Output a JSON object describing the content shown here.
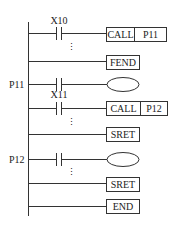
{
  "diagram": {
    "type": "ladder",
    "rungs": [
      {
        "label": "",
        "contact": "X10",
        "output": {
          "kind": "box",
          "parts": [
            "CALL",
            "P11"
          ]
        },
        "ellipsis_after": true
      },
      {
        "label": "",
        "contact": "",
        "output": {
          "kind": "box",
          "parts": [
            "FEND"
          ]
        }
      },
      {
        "label": "P11",
        "contact": "",
        "output": {
          "kind": "coil",
          "parts": []
        }
      },
      {
        "label": "",
        "contact": "X11",
        "output": {
          "kind": "box",
          "parts": [
            "CALL",
            "P12"
          ]
        },
        "ellipsis_after": true
      },
      {
        "label": "",
        "contact": "",
        "output": {
          "kind": "box",
          "parts": [
            "SRET"
          ]
        }
      },
      {
        "label": "P12",
        "contact": "",
        "output": {
          "kind": "coil",
          "parts": []
        },
        "ellipsis_after": true
      },
      {
        "label": "",
        "contact": "",
        "output": {
          "kind": "box",
          "parts": [
            "SRET"
          ]
        }
      },
      {
        "label": "",
        "contact": "",
        "output": {
          "kind": "box",
          "parts": [
            "END"
          ]
        }
      }
    ]
  },
  "labels": {
    "x10": "X10",
    "call1": "CALL",
    "p11_target": "P11",
    "fend": "FEND",
    "p11": "P11",
    "x11": "X11",
    "call2": "CALL",
    "p12_target": "P12",
    "sret1": "SRET",
    "p12": "P12",
    "sret2": "SRET",
    "end": "END",
    "ellipsis": "⋮"
  }
}
